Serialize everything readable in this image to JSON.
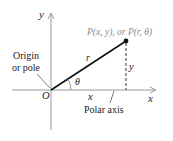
{
  "diagram": {
    "labels": {
      "y_axis": "y",
      "x_axis": "x",
      "point": "P(x, y), or P(r, θ)",
      "origin_line1": "Origin",
      "origin_line2": "or pole",
      "origin": "O",
      "radius": "r",
      "height": "y",
      "angle": "θ",
      "base": "x",
      "polar_axis": "Polar axis"
    },
    "colors": {
      "axis": "#9a9a9a",
      "segment": "#111111",
      "point_label": "#8a8a8a",
      "text": "#222222"
    }
  }
}
